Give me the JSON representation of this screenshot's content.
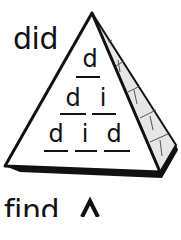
{
  "exercise": {
    "word": "did",
    "rows": [
      [
        "d"
      ],
      [
        "d",
        "i"
      ],
      [
        "d",
        "i",
        "d"
      ]
    ]
  },
  "next_exercise": {
    "word": "find"
  }
}
